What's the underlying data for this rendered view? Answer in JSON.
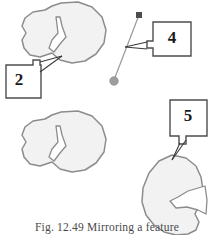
{
  "figure": {
    "caption": "Fig. 12.49  Mirroring a feature",
    "colors": {
      "shape_fill": "#f2f2f2",
      "shape_stroke": "#8c8c8c",
      "callout_stroke": "#4d4d4d",
      "leader_stroke": "#3a3a3a",
      "axis_stroke": "#999999",
      "axis_square_fill": "#4d4d4d",
      "axis_circle_fill": "#9e9e9e",
      "number_color": "#1a1a1a",
      "caption_color": "#4a4a4a",
      "background": "#ffffff"
    }
  },
  "callouts": [
    {
      "id": "2",
      "label": "2",
      "target": "original-feature-notch-upper"
    },
    {
      "id": "4",
      "label": "4",
      "target": "mirror-axis-line"
    },
    {
      "id": "5",
      "label": "5",
      "target": "mirrored-feature"
    }
  ],
  "shapes": [
    {
      "name": "original-feature-upper",
      "description": "polygonal blob with wedge notch, notch opening left"
    },
    {
      "name": "original-feature-lower",
      "description": "identical polygonal blob with wedge notch"
    },
    {
      "name": "mirrored-feature",
      "description": "mirrored polygonal blob, notch opening right"
    }
  ],
  "mirror_axis": {
    "name": "mirror-axis-line",
    "start_handle": "square",
    "end_handle": "circle",
    "x1": 139,
    "y1": 15,
    "x2": 114,
    "y2": 80
  }
}
